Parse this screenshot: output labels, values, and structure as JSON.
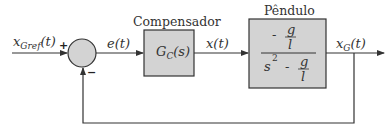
{
  "diagram": {
    "type": "block-diagram",
    "colors": {
      "block_fill": "#d3d3d3",
      "line": "#333333",
      "background": "#ffffff"
    },
    "input_signal": {
      "base": "x",
      "subscript": "Gref",
      "arg": "(t)"
    },
    "summing_junction": {
      "plus_sign": "+",
      "minus_sign": "−"
    },
    "error_signal": "e(t)",
    "compensator": {
      "title": "Compensador",
      "transfer_function": {
        "base": "G",
        "subscript": "C",
        "arg": "(s)"
      }
    },
    "control_signal": "x(t)",
    "plant": {
      "title": "Pêndulo",
      "numerator": {
        "sign": "-",
        "frac_num": "g",
        "frac_den": "l"
      },
      "denominator": {
        "term": "s",
        "exponent": "2",
        "sign": "-",
        "frac_num": "g",
        "frac_den": "l"
      }
    },
    "output_signal": {
      "base": "x",
      "subscript": "G",
      "arg": "(t)"
    },
    "feedback": "unity negative feedback from output to summing junction"
  }
}
